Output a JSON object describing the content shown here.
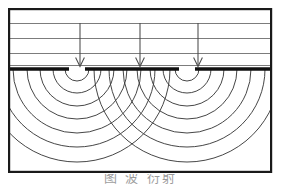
{
  "figure": {
    "caption": "图  波  衍射",
    "line_color": "#1a1a1a",
    "wave_color": "#3c3c3c",
    "incident_line_color": "#6e6e6e",
    "barrier_color": "#111111",
    "background": "#ffffff"
  },
  "frame": {
    "x": 8,
    "y": 8,
    "width": 264,
    "height": 165,
    "stroke_width": 2.2
  },
  "incident_region": {
    "label": "incident-plane-waves",
    "wavefront_y": [
      23,
      38,
      53,
      65
    ],
    "stroke_width": 0.9
  },
  "arrows": {
    "label": "propagation-direction-arrows",
    "x_positions": [
      80,
      140,
      198
    ],
    "start_y": 23,
    "end_y": 66,
    "head_width": 9,
    "head_height": 9,
    "stroke_width": 1.0
  },
  "barrier": {
    "label": "barrier-with-two-slits",
    "y": 69,
    "stroke_width": 3.4,
    "segments": [
      {
        "x1": 8,
        "x2": 69
      },
      {
        "x1": 85,
        "x2": 179
      },
      {
        "x1": 195,
        "x2": 272
      }
    ],
    "slits": [
      {
        "center_x": 77,
        "width": 16
      },
      {
        "center_x": 187,
        "width": 16
      }
    ]
  },
  "wave_sources": {
    "label": "huygens-secondary-wavelets",
    "centers_x": [
      77,
      187
    ],
    "center_y": 69,
    "radii": [
      12,
      24,
      37,
      50,
      64,
      78,
      93
    ],
    "stroke_width": 0.95
  },
  "clip": {
    "bottom_y": 171
  }
}
